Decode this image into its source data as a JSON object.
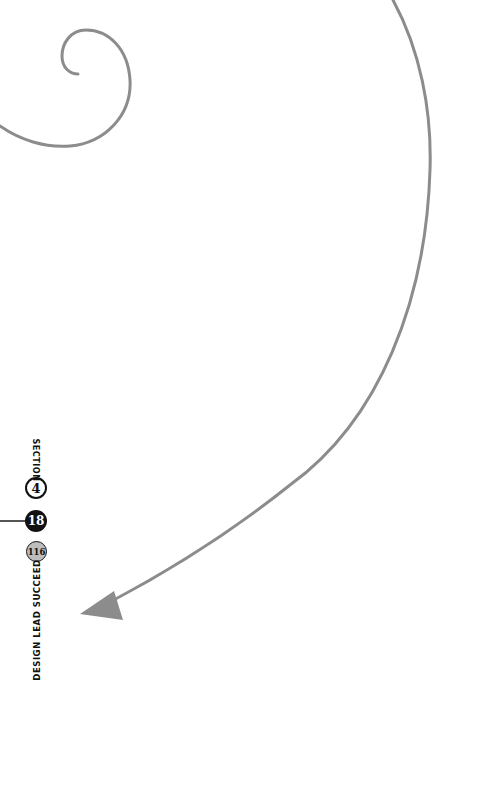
{
  "page": {
    "section_label": "SECTION",
    "section_number": "4",
    "chapter_number": "18",
    "page_number": "116",
    "book_title": "DESIGN LEAD SUCCEED"
  },
  "colors": {
    "stroke": "#8c8c8c",
    "ink": "#111111",
    "page_badge_fill": "#bdbdbd"
  },
  "decorations": {
    "spiral": "curl-line",
    "arrow": "curved-arrow-pointing-down-left"
  }
}
